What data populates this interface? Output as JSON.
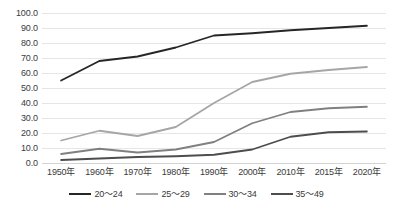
{
  "chart_data": {
    "type": "line",
    "title": "",
    "subtitle": "",
    "xlabel": "",
    "ylabel": "",
    "ylim": [
      0,
      100
    ],
    "grid": true,
    "legend_position": "bottom",
    "categories": [
      "1950年",
      "1960年",
      "1970年",
      "1980年",
      "1990年",
      "2000年",
      "2010年",
      "2015年",
      "2020年"
    ],
    "y_ticks": [
      "0.0",
      "10.0",
      "20.0",
      "30.0",
      "40.0",
      "50.0",
      "60.0",
      "70.0",
      "80.0",
      "90.0",
      "100.0"
    ],
    "y_tick_values": [
      0,
      10,
      20,
      30,
      40,
      50,
      60,
      70,
      80,
      90,
      100
    ],
    "series": [
      {
        "name": "20～24",
        "color": "#262626",
        "values": [
          55.0,
          68.0,
          71.0,
          77.0,
          85.0,
          86.5,
          88.5,
          90.0,
          91.5
        ]
      },
      {
        "name": "25～29",
        "color": "#a6a6a6",
        "values": [
          15.0,
          21.5,
          18.0,
          24.0,
          40.0,
          54.0,
          59.5,
          62.0,
          64.0
        ]
      },
      {
        "name": "30～34",
        "color": "#808080",
        "values": [
          6.0,
          9.5,
          7.0,
          9.0,
          14.0,
          26.5,
          34.0,
          36.5,
          37.5
        ]
      },
      {
        "name": "35～49",
        "color": "#4d4d4d",
        "values": [
          2.0,
          3.0,
          4.0,
          4.5,
          5.5,
          9.0,
          17.5,
          20.5,
          21.0
        ]
      }
    ]
  },
  "style": {
    "background": "#ffffff",
    "gridline_color": "#e6e6e6",
    "axis_color": "#d3d3d3",
    "text_color": "#3a3a3a"
  }
}
